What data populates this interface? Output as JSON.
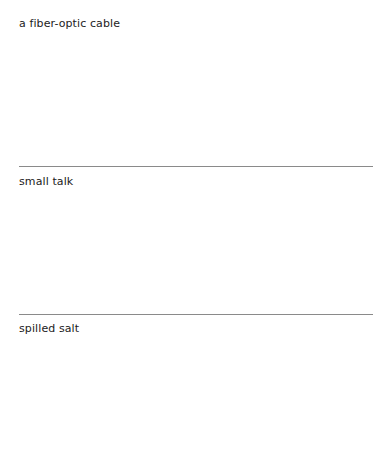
{
  "items": [
    {
      "label": "a fiber-optic cable"
    },
    {
      "label": "small talk"
    },
    {
      "label": "spilled salt"
    }
  ]
}
